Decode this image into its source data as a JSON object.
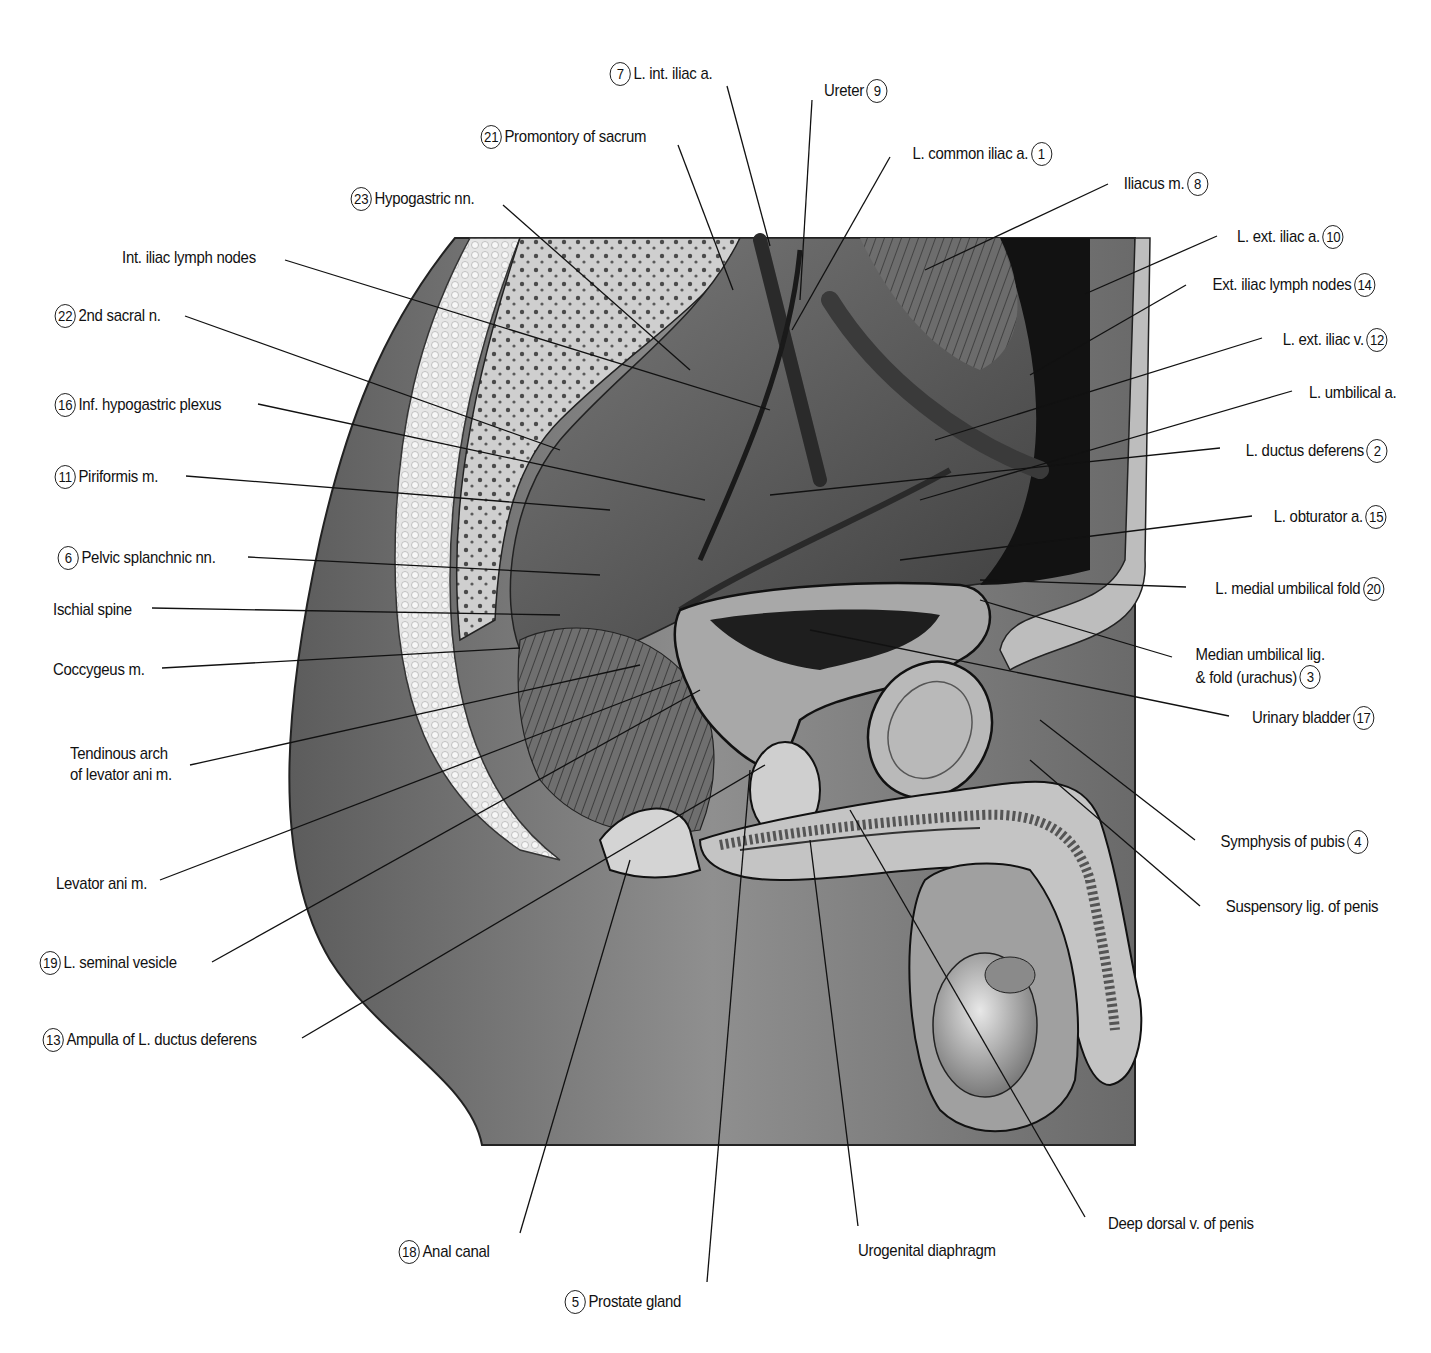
{
  "figure": {
    "type": "anatomical-illustration",
    "style": "grayscale pen-and-ink"
  },
  "colors": {
    "background": "#ffffff",
    "ink": "#111111",
    "skin_dark": "#6e6e6e",
    "skin_mid": "#9a9a9a",
    "bone_light": "#d9d9d9",
    "cavity_dark": "#141414"
  },
  "labels": [
    {
      "id": "l7",
      "num": "7",
      "text": "L. int. iliac a.",
      "x": 607,
      "y": 62,
      "side": "left",
      "line": [
        [
          727,
          86
        ],
        [
          770,
          246
        ]
      ]
    },
    {
      "id": "l9",
      "num": "9",
      "text": "Ureter",
      "x": 815,
      "y": 79,
      "side": "right",
      "line": [
        [
          812,
          100
        ],
        [
          800,
          300
        ]
      ]
    },
    {
      "id": "l21",
      "num": "21",
      "text": "Promontory of sacrum",
      "x": 478,
      "y": 125,
      "side": "left",
      "line": [
        [
          678,
          145
        ],
        [
          733,
          290
        ]
      ]
    },
    {
      "id": "l1",
      "num": "1",
      "text": "L. common iliac a.",
      "x": 893,
      "y": 142,
      "side": "right",
      "line": [
        [
          890,
          157
        ],
        [
          792,
          330
        ]
      ]
    },
    {
      "id": "l23",
      "num": "23",
      "text": "Hypogastric nn.",
      "x": 348,
      "y": 187,
      "side": "left",
      "line": [
        [
          503,
          205
        ],
        [
          690,
          370
        ]
      ]
    },
    {
      "id": "l8",
      "num": "8",
      "text": "Iliacus m.",
      "x": 1112,
      "y": 172,
      "side": "right",
      "line": [
        [
          1108,
          184
        ],
        [
          925,
          270
        ]
      ]
    },
    {
      "id": "lintlymph",
      "num": "",
      "text": "Int. iliac lymph nodes",
      "x": 122,
      "y": 247,
      "side": "left",
      "line": [
        [
          285,
          260
        ],
        [
          770,
          410
        ]
      ]
    },
    {
      "id": "l10",
      "num": "10",
      "text": "L. ext. iliac a.",
      "x": 1222,
      "y": 225,
      "side": "right",
      "line": [
        [
          1217,
          236
        ],
        [
          1085,
          294
        ]
      ]
    },
    {
      "id": "l14",
      "num": "14",
      "text": "Ext. iliac lymph nodes",
      "x": 1190,
      "y": 273,
      "side": "right",
      "line": [
        [
          1186,
          285
        ],
        [
          1030,
          375
        ]
      ]
    },
    {
      "id": "l22",
      "num": "22",
      "text": "2nd sacral n.",
      "x": 52,
      "y": 304,
      "side": "left",
      "line": [
        [
          185,
          316
        ],
        [
          560,
          450
        ]
      ]
    },
    {
      "id": "l12",
      "num": "12",
      "text": "L. ext. iliac v.",
      "x": 1268,
      "y": 328,
      "side": "right",
      "line": [
        [
          1262,
          338
        ],
        [
          935,
          440
        ]
      ]
    },
    {
      "id": "lumbil",
      "num": "",
      "text": "L. umbilical a.",
      "x": 1297,
      "y": 382,
      "side": "right",
      "line": [
        [
          1292,
          391
        ],
        [
          920,
          500
        ]
      ]
    },
    {
      "id": "l16",
      "num": "16",
      "text": "Inf. hypogastric plexus",
      "x": 52,
      "y": 393,
      "side": "left",
      "line": [
        [
          258,
          404
        ],
        [
          705,
          500
        ]
      ]
    },
    {
      "id": "l2",
      "num": "2",
      "text": "L. ductus deferens",
      "x": 1226,
      "y": 439,
      "side": "right",
      "line": [
        [
          1220,
          448
        ],
        [
          770,
          495
        ]
      ]
    },
    {
      "id": "l11",
      "num": "11",
      "text": "Piriformis m.",
      "x": 52,
      "y": 465,
      "side": "left",
      "line": [
        [
          186,
          476
        ],
        [
          610,
          510
        ]
      ]
    },
    {
      "id": "l15",
      "num": "15",
      "text": "L. obturator a.",
      "x": 1258,
      "y": 505,
      "side": "right",
      "line": [
        [
          1252,
          516
        ],
        [
          900,
          560
        ]
      ]
    },
    {
      "id": "l6",
      "num": "6",
      "text": "Pelvic splanchnic nn.",
      "x": 55,
      "y": 546,
      "side": "left",
      "line": [
        [
          248,
          557
        ],
        [
          600,
          575
        ]
      ]
    },
    {
      "id": "l20",
      "num": "20",
      "text": "L. medial umbilical fold",
      "x": 1192,
      "y": 577,
      "side": "right",
      "line": [
        [
          1186,
          587
        ],
        [
          980,
          580
        ]
      ]
    },
    {
      "id": "lischial",
      "num": "",
      "text": "Ischial spine",
      "x": 53,
      "y": 599,
      "side": "left",
      "line": [
        [
          152,
          608
        ],
        [
          560,
          615
        ]
      ]
    },
    {
      "id": "lcoccy",
      "num": "",
      "text": "Coccygeus m.",
      "x": 53,
      "y": 659,
      "side": "left",
      "line": [
        [
          162,
          668
        ],
        [
          520,
          648
        ]
      ]
    },
    {
      "id": "l3",
      "num": "3",
      "text": "Median umbilical lig.\n& fold (urachus)",
      "x": 1178,
      "y": 644,
      "side": "right",
      "multiline": true,
      "line": [
        [
          1172,
          657
        ],
        [
          980,
          600
        ]
      ]
    },
    {
      "id": "l17",
      "num": "17",
      "text": "Urinary bladder",
      "x": 1235,
      "y": 706,
      "side": "right",
      "line": [
        [
          1229,
          716
        ],
        [
          810,
          630
        ]
      ]
    },
    {
      "id": "ltend",
      "num": "",
      "text": "Tendinous arch\nof levator ani m.",
      "x": 70,
      "y": 743,
      "side": "left",
      "multiline": true,
      "line": [
        [
          190,
          765
        ],
        [
          640,
          665
        ]
      ]
    },
    {
      "id": "l4",
      "num": "4",
      "text": "Symphysis of pubis",
      "x": 1200,
      "y": 830,
      "side": "right",
      "line": [
        [
          1195,
          840
        ],
        [
          1040,
          720
        ]
      ]
    },
    {
      "id": "llevator",
      "num": "",
      "text": "Levator ani m.",
      "x": 56,
      "y": 873,
      "side": "left",
      "line": [
        [
          160,
          880
        ],
        [
          680,
          680
        ]
      ]
    },
    {
      "id": "lsusp",
      "num": "",
      "text": "Suspensory lig. of penis",
      "x": 1205,
      "y": 896,
      "side": "right",
      "line": [
        [
          1200,
          906
        ],
        [
          1030,
          760
        ]
      ]
    },
    {
      "id": "l19",
      "num": "19",
      "text": "L. seminal vesicle",
      "x": 37,
      "y": 951,
      "side": "left",
      "line": [
        [
          212,
          962
        ],
        [
          700,
          690
        ]
      ]
    },
    {
      "id": "l13",
      "num": "13",
      "text": "Ampulla of L. ductus deferens",
      "x": 40,
      "y": 1028,
      "side": "left",
      "line": [
        [
          302,
          1038
        ],
        [
          765,
          765
        ]
      ]
    },
    {
      "id": "ldeepdorsal",
      "num": "",
      "text": "Deep dorsal v. of penis",
      "x": 1088,
      "y": 1213,
      "side": "right",
      "line": [
        [
          1085,
          1217
        ],
        [
          850,
          810
        ]
      ]
    },
    {
      "id": "l18",
      "num": "18",
      "text": "Anal canal",
      "x": 396,
      "y": 1240,
      "side": "left",
      "line": [
        [
          520,
          1233
        ],
        [
          630,
          860
        ]
      ]
    },
    {
      "id": "lurogen",
      "num": "",
      "text": "Urogenital diaphragm",
      "x": 858,
      "y": 1240,
      "side": "left",
      "line": [
        [
          858,
          1226
        ],
        [
          810,
          840
        ]
      ]
    },
    {
      "id": "l5",
      "num": "5",
      "text": "Prostate gland",
      "x": 562,
      "y": 1290,
      "side": "left",
      "line": [
        [
          707,
          1282
        ],
        [
          750,
          770
        ]
      ]
    }
  ]
}
